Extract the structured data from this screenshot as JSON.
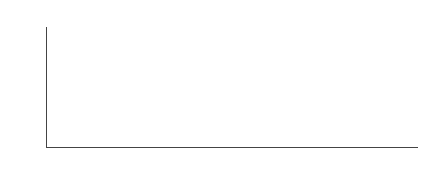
{
  "chart_data": {
    "type": "bar",
    "stacked": true,
    "percent": true,
    "title": "",
    "xlabel": "",
    "ylabel": "",
    "ylim": [
      0,
      100
    ],
    "yticks": [
      "0%",
      "10%",
      "20%",
      "30%",
      "40%",
      "50%",
      "60%",
      "70%",
      "80%",
      "90%",
      "100%"
    ],
    "legend_position": "top",
    "grid": false,
    "categories": [
      "1956",
      "1978",
      "1991",
      "1993",
      "1995",
      "1996",
      "1999",
      "2000",
      "2001",
      "2002",
      "2003",
      "2004",
      "2005",
      "2006",
      "2009",
      "2011",
      "2012",
      "2013",
      "2014",
      "2015",
      "2016",
      "2017"
    ],
    "series": [
      {
        "name": "5分",
        "color": "#e2e2e2",
        "values": [
          50,
          100,
          0,
          0,
          33,
          0,
          20,
          0,
          10,
          14,
          17,
          0,
          0,
          14,
          0,
          17,
          9,
          10,
          13,
          8,
          28,
          20
        ]
      },
      {
        "name": "4分",
        "color": "#b9b9b9",
        "values": [
          0,
          0,
          0,
          100,
          0,
          0,
          0,
          0,
          20,
          0,
          0,
          0,
          100,
          7,
          0,
          33,
          0,
          30,
          32,
          9,
          20,
          15
        ]
      },
      {
        "name": "3分",
        "color": "#8f8f8f",
        "values": [
          0,
          0,
          100,
          0,
          67,
          50,
          13,
          20,
          20,
          14,
          33,
          0,
          0,
          21,
          50,
          50,
          50,
          10,
          23,
          18,
          22,
          30
        ]
      },
      {
        "name": "2分",
        "color": "#4f4f4f",
        "values": [
          50,
          0,
          0,
          0,
          0,
          50,
          53,
          67,
          30,
          43,
          40,
          100,
          0,
          36,
          0,
          0,
          30,
          9,
          27,
          46,
          23,
          27
        ]
      },
      {
        "name": "1分",
        "color": "#2a2a2a",
        "values": [
          0,
          0,
          0,
          0,
          0,
          0,
          14,
          13,
          20,
          29,
          10,
          0,
          0,
          22,
          50,
          0,
          11,
          41,
          5,
          19,
          7,
          8
        ]
      }
    ]
  },
  "legend": {
    "items": [
      {
        "label": "5分",
        "color": "#e2e2e2"
      },
      {
        "label": "4分",
        "color": "#b9b9b9"
      },
      {
        "label": "3分",
        "color": "#8f8f8f"
      },
      {
        "label": "2分",
        "color": "#4f4f4f"
      },
      {
        "label": "1分",
        "color": "#2a2a2a"
      }
    ]
  }
}
